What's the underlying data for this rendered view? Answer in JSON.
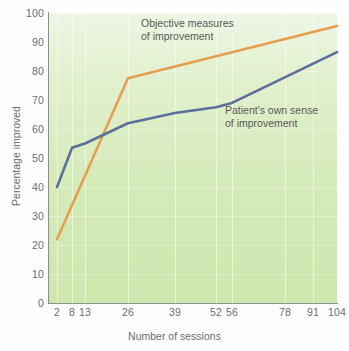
{
  "chart_data": {
    "type": "line",
    "title": "",
    "xlabel": "Number of sessions",
    "ylabel": "Percentage improved",
    "xlim": [
      0,
      104
    ],
    "ylim": [
      0,
      100
    ],
    "grid": true,
    "legend_position": "inline-annotation",
    "x_ticks": [
      2,
      8,
      13,
      26,
      39,
      52,
      56,
      78,
      91,
      104
    ],
    "x_tick_labels": [
      "2",
      "8",
      "13",
      "26",
      "39",
      "52",
      "56",
      "78",
      "91",
      "104"
    ],
    "y_ticks": [
      0,
      10,
      20,
      30,
      40,
      50,
      60,
      70,
      80,
      90,
      100
    ],
    "y_tick_labels": [
      "0",
      "10",
      "20",
      "30",
      "40",
      "50",
      "60",
      "70",
      "80",
      "90",
      "100"
    ],
    "series": [
      {
        "name": "Objective measures of improvement",
        "color": "#e5a04f",
        "annotation": "Objective measures\nof improvement",
        "x": [
          2,
          26,
          104
        ],
        "values": [
          22,
          77.5,
          95.5
        ]
      },
      {
        "name": "Patient's own sense of improvement",
        "color": "#5b6f9b",
        "annotation": "Patient's own sense\nof improvement",
        "x": [
          2,
          8,
          13,
          26,
          39,
          52,
          56,
          104
        ],
        "values": [
          40,
          53.5,
          55,
          62,
          65.5,
          67.5,
          69,
          86.5
        ]
      }
    ]
  },
  "axes": {
    "y_title": "Percentage improved",
    "x_title": "Number of sessions",
    "y_labels": [
      "100",
      "90",
      "80",
      "70",
      "60",
      "50",
      "40",
      "30",
      "20",
      "10",
      "0"
    ],
    "x_labels": [
      "2",
      "8",
      "13",
      "26",
      "39",
      "52",
      "56",
      "78",
      "91",
      "104"
    ]
  },
  "annotations": {
    "objective_line1": "Objective measures",
    "objective_line2": "of improvement",
    "patient_line1": "Patient's own sense",
    "patient_line2": "of improvement"
  },
  "colors": {
    "objective": "#e5a04f",
    "patient": "#5b6f9b",
    "plot_background_top": "#eef6e4",
    "plot_background_bottom": "#cde7ae",
    "axis": "#8e8e8e",
    "tick_text": "#6d6d6d",
    "annotation_text": "#58585a"
  },
  "caption": ""
}
